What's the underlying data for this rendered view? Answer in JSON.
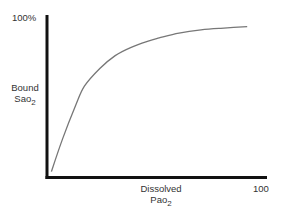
{
  "chart_data": {
    "type": "line",
    "title": "",
    "xlabel": "Dissolved Pao2",
    "ylabel": "Bound Sao2",
    "xlim": [
      0,
      100
    ],
    "ylim": [
      0,
      100
    ],
    "x_tick_labels": [
      "100"
    ],
    "y_tick_labels": [
      "100%"
    ],
    "grid": false,
    "legend": null,
    "series": [
      {
        "name": "Bound Sao2 vs Dissolved Pao2",
        "color": "#777777",
        "x": [
          2,
          7,
          13,
          17,
          24,
          31,
          38,
          46,
          51,
          60,
          70,
          79,
          91
        ],
        "y": [
          4,
          24,
          45,
          57,
          68,
          76,
          81,
          85,
          87,
          90,
          92,
          93,
          94
        ]
      }
    ]
  },
  "labels": {
    "y_top": "100%",
    "y_label_line1": "Bound",
    "y_label_line2_main": "Sao",
    "y_label_line2_sub": "2",
    "x_label_line1": "Dissolved",
    "x_label_line2_main": "Pao",
    "x_label_line2_sub": "2",
    "x_right": "100"
  },
  "colors": {
    "axis": "#111111",
    "curve": "#777777",
    "background": "#ffffff"
  }
}
